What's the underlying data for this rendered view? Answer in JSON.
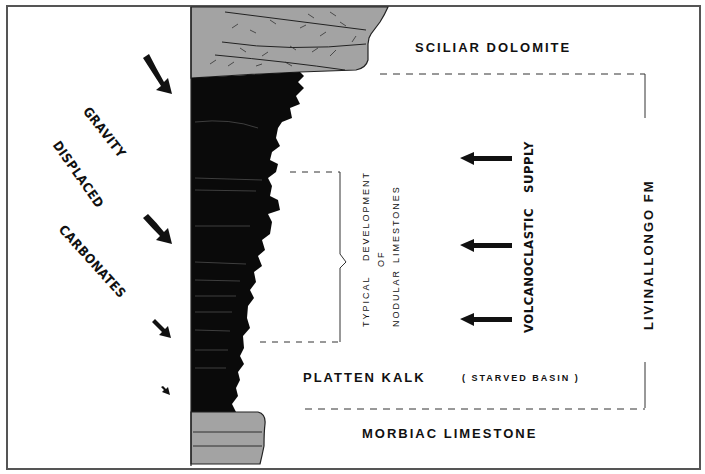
{
  "figure": {
    "type": "stratigraphic-column-diagram",
    "colors": {
      "carbonate_fill": "#a3a3a3",
      "basin_fill": "#0a0a0a",
      "line": "#222222",
      "frame": "#555555"
    }
  },
  "labels": {
    "sciliar_dolomite": "SCILIAR    DOLOMITE",
    "gravity": "GRAVITY",
    "displaced": "DISPLACED",
    "carbonates": "CARBONATES",
    "supply": "SUPPLY",
    "volcanoclastic": "VOLCANOCLASTIC",
    "livinallongo": "LIVINALLONGO     FM",
    "typical": "TYPICAL",
    "development": "DEVELOPMENT",
    "of": "OF",
    "nodular": "NODULAR",
    "limestones": "LIMESTONES",
    "platten_kalk": "PLATTEN    KALK",
    "starved_basin": "( STARVED    BASIN )",
    "morbiac_limestone": "MORBIAC    LIMESTONE"
  },
  "units": [
    {
      "name": "Sciliar Dolomite",
      "position": "top",
      "fill": "grey"
    },
    {
      "name": "Livinallongo Fm",
      "position": "middle",
      "fill": "black"
    },
    {
      "name": "Platten Kalk (Starved Basin)",
      "position": "lower-middle",
      "fill": "black"
    },
    {
      "name": "Morbiac Limestone",
      "position": "bottom",
      "fill": "grey"
    }
  ],
  "arrows": {
    "gravity_arrows": 4,
    "volcanoclastic_arrows": 3
  }
}
